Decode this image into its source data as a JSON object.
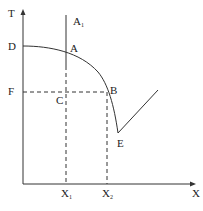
{
  "diagram": {
    "type": "phase-diagram",
    "axes": {
      "y_label": "T",
      "x_label": "X"
    },
    "points": {
      "D": "D",
      "A": "A",
      "A1": "A",
      "A1_sub": "1",
      "F": "F",
      "C": "C",
      "B": "B",
      "E": "E",
      "X1": "X",
      "X1_sub": "1",
      "X2": "X",
      "X2_sub": "2"
    },
    "caption": "",
    "colors": {
      "line": "#333333",
      "background": "#ffffff"
    }
  }
}
